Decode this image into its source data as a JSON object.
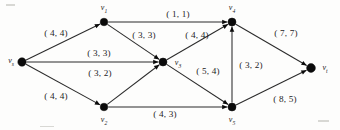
{
  "figure": {
    "width": 340,
    "height": 130,
    "background_color": "#fdfdfc",
    "ink_color": "#1c1c1c"
  },
  "chart_data": {
    "type": "diagram",
    "diagram_kind": "directed-graph-network-flow",
    "title": "",
    "label_format": "(capacity, flow)",
    "nodes": [
      {
        "id": "vs",
        "label": "v",
        "subscript": "s",
        "x": 22,
        "y": 62,
        "r": 4.2,
        "label_x": 11,
        "label_y": 62
      },
      {
        "id": "v1",
        "label": "v",
        "subscript": "1",
        "x": 104,
        "y": 22,
        "r": 3.8,
        "label_x": 104,
        "label_y": 9
      },
      {
        "id": "v2",
        "label": "v",
        "subscript": "2",
        "x": 104,
        "y": 107,
        "r": 3.8,
        "label_x": 104,
        "label_y": 121
      },
      {
        "id": "v3",
        "label": "v",
        "subscript": "3",
        "x": 163,
        "y": 62,
        "r": 4.0,
        "label_x": 178,
        "label_y": 64
      },
      {
        "id": "v4",
        "label": "v",
        "subscript": "4",
        "x": 232,
        "y": 22,
        "r": 4.0,
        "label_x": 232,
        "label_y": 9
      },
      {
        "id": "v5",
        "label": "v",
        "subscript": "5",
        "x": 232,
        "y": 107,
        "r": 4.0,
        "label_x": 232,
        "label_y": 121
      },
      {
        "id": "vt",
        "label": "v",
        "subscript": "t",
        "x": 311,
        "y": 68,
        "r": 4.4,
        "label_x": 325,
        "label_y": 69
      }
    ],
    "edges": [
      {
        "from": "vs",
        "to": "v1",
        "capacity": 4,
        "flow": 4,
        "label": "( 4,  4)",
        "label_x": 56,
        "label_y": 34
      },
      {
        "from": "vs",
        "to": "v3",
        "capacity": 3,
        "flow": 3,
        "label": "( 3,  3)",
        "label_x": 99,
        "label_y": 54
      },
      {
        "from": "vs",
        "to": "v2",
        "capacity": 4,
        "flow": 4,
        "label": "( 4,  4)",
        "label_x": 56,
        "label_y": 97
      },
      {
        "from": "v1",
        "to": "v4",
        "capacity": 1,
        "flow": 1,
        "label": "( 1,  1)",
        "label_x": 178,
        "label_y": 15
      },
      {
        "from": "v1",
        "to": "v3",
        "capacity": 3,
        "flow": 3,
        "label": "( 3,  3)",
        "label_x": 144,
        "label_y": 36
      },
      {
        "from": "v2",
        "to": "v3",
        "capacity": 3,
        "flow": 2,
        "label": "( 3,  2)",
        "label_x": 100,
        "label_y": 74
      },
      {
        "from": "v2",
        "to": "v5",
        "capacity": 4,
        "flow": 3,
        "label": "( 4,  3)",
        "label_x": 165,
        "label_y": 115
      },
      {
        "from": "v3",
        "to": "v4",
        "capacity": 4,
        "flow": 4,
        "label": "( 4,  4)",
        "label_x": 197,
        "label_y": 36
      },
      {
        "from": "v3",
        "to": "v5",
        "capacity": 5,
        "flow": 4,
        "label": "( 5,  4)",
        "label_x": 208,
        "label_y": 72
      },
      {
        "from": "v5",
        "to": "v4",
        "capacity": 3,
        "flow": 2,
        "label": "( 3,  2)",
        "label_x": 251,
        "label_y": 66
      },
      {
        "from": "v4",
        "to": "vt",
        "capacity": 7,
        "flow": 7,
        "label": "( 7,  7)",
        "label_x": 286,
        "label_y": 34
      },
      {
        "from": "v5",
        "to": "vt",
        "capacity": 8,
        "flow": 5,
        "label": "( 8,  5)",
        "label_x": 285,
        "label_y": 100
      }
    ]
  }
}
